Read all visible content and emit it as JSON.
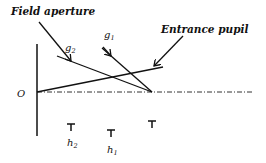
{
  "diagram": {
    "labels": {
      "field_aperture": "Field aperture",
      "entrance_pupil": "Entrance pupil",
      "origin": "O",
      "g1_base": "g",
      "g1_sub": "1",
      "g2_base": "g",
      "g2_sub": "2",
      "h1_base": "h",
      "h1_sub": "1",
      "h2_base": "h",
      "h2_sub": "2"
    },
    "colors": {
      "stroke": "#111111",
      "background": "#ffffff"
    }
  }
}
